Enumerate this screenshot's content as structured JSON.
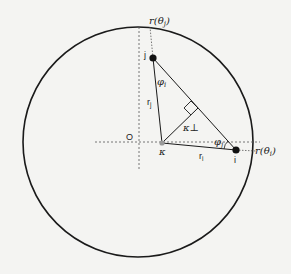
{
  "diagram": {
    "colors": {
      "background": "#f4f4f2",
      "stroke": "#1a1a1a",
      "dotted": "#555555",
      "kappa_point": "#9a9a9a"
    },
    "circle": {
      "cx": 138,
      "cy": 142,
      "r": 115
    },
    "points": {
      "origin": {
        "label": "O",
        "x": 139,
        "y": 142
      },
      "kappa": {
        "label": "κ",
        "x": 162,
        "y": 143
      },
      "i": {
        "label": "i",
        "x": 236,
        "y": 150
      },
      "j": {
        "label": "j",
        "x": 153,
        "y": 58
      }
    },
    "labels": {
      "r_theta_j": "r(θj)",
      "r_theta_i": "r(θi)",
      "phi_i": "φi",
      "phi_j": "φj",
      "kappa_perp": "κ⊥",
      "r_j": "rj",
      "r_i": "ri",
      "origin": "O",
      "kappa": "κ",
      "point_i": "i",
      "point_j": "j"
    }
  }
}
